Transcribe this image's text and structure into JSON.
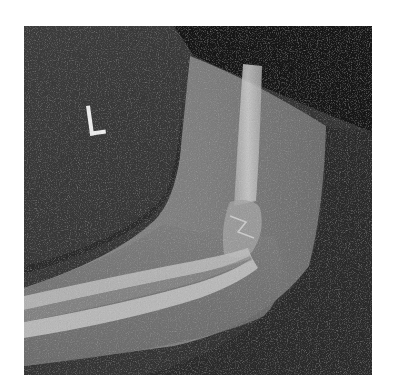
{
  "caption": {
    "text": "",
    "note_visible": "cropped text line at top edge, illegible"
  },
  "image": {
    "type": "radiograph",
    "view": "lateral elbow",
    "side_marker": "L",
    "colors": {
      "background_dark": "#141414",
      "background_mid": "#3a3a3a",
      "soft_tissue": "#7a7a7a",
      "soft_tissue_light": "#8e8e8e",
      "bone": "#b9b9b9",
      "bone_bright": "#d4d4d4",
      "marker": "#e8e8e8"
    }
  }
}
